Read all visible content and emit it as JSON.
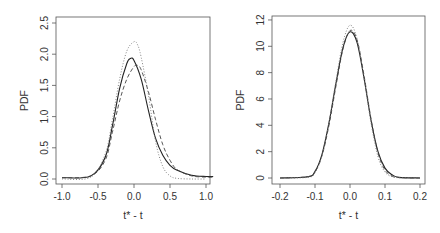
{
  "chart_data": [
    {
      "type": "line",
      "title": "",
      "xlabel": "t* - t",
      "ylabel": "PDF",
      "xlim": [
        -1.05,
        1.1
      ],
      "ylim": [
        0,
        2.5
      ],
      "xticks": [
        "-1.0",
        "-0.5",
        "0.0",
        "0.5",
        "1.0"
      ],
      "yticks": [
        "0.0",
        "0.5",
        "1.0",
        "1.5",
        "2.0",
        "2.5"
      ],
      "grid": false,
      "legend": "none",
      "series": [
        {
          "name": "solid",
          "style": "solid",
          "x": [
            -1.0,
            -0.6,
            -0.4,
            -0.3,
            -0.2,
            -0.1,
            -0.05,
            0.0,
            0.1,
            0.2,
            0.3,
            0.4,
            0.5,
            0.6,
            0.8,
            1.0,
            1.1
          ],
          "y": [
            0.02,
            0.05,
            0.35,
            0.85,
            1.45,
            1.85,
            1.93,
            1.9,
            1.6,
            1.1,
            0.65,
            0.38,
            0.22,
            0.14,
            0.06,
            0.04,
            0.04
          ]
        },
        {
          "name": "dashed",
          "style": "dashed",
          "x": [
            -1.0,
            -0.6,
            -0.4,
            -0.3,
            -0.2,
            -0.1,
            0.0,
            0.05,
            0.1,
            0.2,
            0.3,
            0.4,
            0.5,
            0.6,
            0.8,
            1.0,
            1.1
          ],
          "y": [
            0.02,
            0.05,
            0.3,
            0.75,
            1.25,
            1.6,
            1.8,
            1.82,
            1.75,
            1.4,
            0.95,
            0.55,
            0.3,
            0.15,
            0.05,
            0.03,
            0.03
          ]
        },
        {
          "name": "dotted",
          "style": "dotted",
          "x": [
            -1.0,
            -0.6,
            -0.4,
            -0.3,
            -0.2,
            -0.1,
            0.0,
            0.05,
            0.1,
            0.2,
            0.3,
            0.4,
            0.5,
            0.6,
            0.8,
            1.0
          ],
          "y": [
            0.0,
            0.03,
            0.4,
            0.95,
            1.6,
            2.05,
            2.2,
            2.15,
            1.95,
            1.35,
            0.6,
            0.2,
            0.05,
            0.01,
            0.0,
            0.0
          ]
        }
      ]
    },
    {
      "type": "line",
      "title": "",
      "xlabel": "t* - t",
      "ylabel": "PDF",
      "xlim": [
        -0.21,
        0.21
      ],
      "ylim": [
        0,
        12
      ],
      "xticks": [
        "-0.2",
        "-0.1",
        "0.0",
        "0.1",
        "0.2"
      ],
      "yticks": [
        "0",
        "2",
        "4",
        "6",
        "8",
        "10",
        "12"
      ],
      "grid": false,
      "legend": "none",
      "series": [
        {
          "name": "solid",
          "style": "solid",
          "x": [
            -0.2,
            -0.12,
            -0.1,
            -0.08,
            -0.06,
            -0.04,
            -0.02,
            0.0,
            0.02,
            0.04,
            0.06,
            0.08,
            0.1,
            0.12,
            0.14,
            0.2
          ],
          "y": [
            0.0,
            0.1,
            0.5,
            1.8,
            4.2,
            7.2,
            9.9,
            11.1,
            10.3,
            7.6,
            4.4,
            2.0,
            0.75,
            0.25,
            0.05,
            0.0
          ]
        },
        {
          "name": "dashed",
          "style": "dashed",
          "x": [
            -0.2,
            -0.12,
            -0.1,
            -0.08,
            -0.06,
            -0.04,
            -0.02,
            0.0,
            0.02,
            0.04,
            0.06,
            0.08,
            0.1,
            0.12,
            0.14,
            0.2
          ],
          "y": [
            0.0,
            0.1,
            0.45,
            1.7,
            4.0,
            7.0,
            9.8,
            11.2,
            10.5,
            7.8,
            4.5,
            1.9,
            0.6,
            0.15,
            0.03,
            0.0
          ]
        },
        {
          "name": "dotted",
          "style": "dotted",
          "x": [
            -0.2,
            -0.12,
            -0.1,
            -0.08,
            -0.06,
            -0.04,
            -0.02,
            0.0,
            0.02,
            0.04,
            0.06,
            0.08,
            0.1,
            0.12,
            0.14,
            0.2
          ],
          "y": [
            0.0,
            0.05,
            0.4,
            1.7,
            4.2,
            7.4,
            10.3,
            11.6,
            10.6,
            7.6,
            4.2,
            1.6,
            0.45,
            0.1,
            0.02,
            0.0
          ]
        }
      ]
    }
  ],
  "panels": [
    {
      "xlabel": "t* - t",
      "ylabel": "PDF"
    },
    {
      "xlabel": "t* - t",
      "ylabel": "PDF"
    }
  ]
}
